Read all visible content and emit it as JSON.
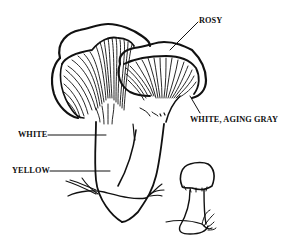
{
  "figure": {
    "ink_color": "#111111",
    "background": "#ffffff"
  },
  "labels": [
    {
      "id": "cap-color",
      "text": "ROSY",
      "x": 199,
      "y": 17,
      "points_to": "cap surface of right mushroom"
    },
    {
      "id": "gill-color",
      "text": "WHITE, AGING GRAY",
      "x": 190,
      "y": 116,
      "points_to": "gills of right mushroom"
    },
    {
      "id": "upper-stalk-color",
      "text": "WHITE",
      "x": 18,
      "y": 126,
      "points_to": "upper stalk"
    },
    {
      "id": "lower-stalk-color",
      "text": "YELLOW",
      "x": 12,
      "y": 164,
      "points_to": "lower stalk"
    }
  ],
  "subjects": [
    {
      "id": "large-mushroom",
      "description": "Mature mushroom, funnel-shaped cap with decurrent gills, long stalk"
    },
    {
      "id": "side-mushroom",
      "description": "Second mature cap viewed from below showing gills"
    },
    {
      "id": "button-mushroom",
      "description": "Small young specimen with rounded cap"
    }
  ]
}
